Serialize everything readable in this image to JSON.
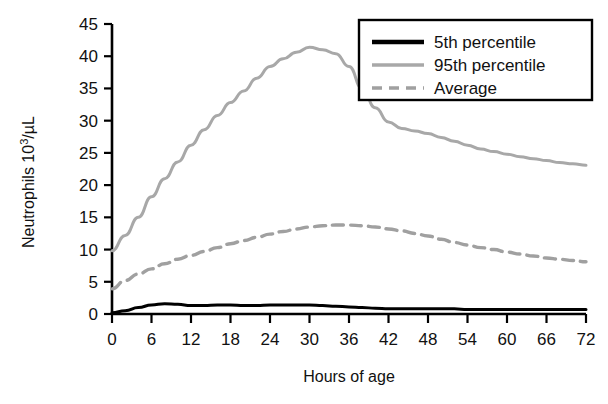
{
  "chart_data": {
    "type": "line",
    "title": "",
    "xlabel": "Hours of age",
    "ylabel": "Neutrophils 10",
    "ylabel_sup": "3",
    "ylabel_tail": "/µL",
    "ylabel_full": "Neutrophils 10³/µL",
    "xlim": [
      0,
      72
    ],
    "ylim": [
      0,
      45
    ],
    "xticks": [
      0,
      6,
      12,
      18,
      24,
      30,
      36,
      42,
      48,
      54,
      60,
      66,
      72
    ],
    "yticks": [
      0,
      5,
      10,
      15,
      20,
      25,
      30,
      35,
      40,
      45
    ],
    "xtick_labels": [
      "0",
      "6",
      "12",
      "18",
      "24",
      "30",
      "36",
      "42",
      "48",
      "54",
      "60",
      "66",
      "72"
    ],
    "ytick_labels": [
      "0",
      "5",
      "10",
      "15",
      "20",
      "25",
      "30",
      "35",
      "40",
      "45"
    ],
    "grid": false,
    "legend_position": "top-right",
    "x": [
      0,
      2,
      4,
      6,
      8,
      10,
      12,
      14,
      16,
      18,
      20,
      22,
      24,
      26,
      28,
      30,
      32,
      34,
      36,
      38,
      40,
      42,
      44,
      46,
      48,
      50,
      52,
      54,
      56,
      58,
      60,
      62,
      64,
      66,
      68,
      70,
      72
    ],
    "series": [
      {
        "name": "5th percentile",
        "style": "solid",
        "color": "#000000",
        "width": 3.0,
        "values": [
          0.2,
          0.5,
          1.0,
          1.4,
          1.6,
          1.5,
          1.3,
          1.3,
          1.4,
          1.4,
          1.3,
          1.3,
          1.4,
          1.4,
          1.4,
          1.4,
          1.3,
          1.2,
          1.1,
          1.0,
          0.9,
          0.8,
          0.8,
          0.8,
          0.8,
          0.8,
          0.8,
          0.7,
          0.7,
          0.7,
          0.7,
          0.7,
          0.7,
          0.7,
          0.7,
          0.7,
          0.7
        ]
      },
      {
        "name": "95th percentile",
        "style": "solid",
        "color": "#a8a8a8",
        "width": 3.0,
        "values": [
          9.8,
          12.2,
          15.0,
          18.2,
          21.0,
          23.6,
          26.2,
          28.6,
          30.8,
          32.8,
          34.6,
          36.6,
          38.4,
          39.6,
          40.6,
          41.4,
          41.0,
          40.4,
          38.4,
          35.0,
          32.0,
          29.8,
          28.8,
          28.4,
          28.0,
          27.4,
          26.8,
          26.2,
          25.6,
          25.2,
          24.8,
          24.4,
          24.1,
          23.8,
          23.5,
          23.3,
          23.1
        ]
      },
      {
        "name": "Average",
        "style": "dashed",
        "color": "#a0a0a0",
        "width": 3.4,
        "values": [
          3.9,
          5.2,
          6.2,
          7.0,
          7.8,
          8.5,
          9.1,
          9.7,
          10.3,
          10.9,
          11.4,
          11.9,
          12.4,
          12.8,
          13.2,
          13.5,
          13.7,
          13.8,
          13.8,
          13.7,
          13.5,
          13.2,
          12.9,
          12.5,
          12.1,
          11.6,
          11.1,
          10.7,
          10.3,
          10.0,
          9.6,
          9.3,
          9.0,
          8.7,
          8.5,
          8.3,
          8.1
        ]
      }
    ],
    "annotations": []
  },
  "legend": {
    "entries": [
      {
        "label": "5th percentile",
        "swatch": "solid-black-line"
      },
      {
        "label": "95th percentile",
        "swatch": "solid-gray-line"
      },
      {
        "label": "Average",
        "swatch": "dashed-gray-line"
      }
    ]
  },
  "colors": {
    "axis": "#000000",
    "series_5th": "#000000",
    "series_95th": "#a8a8a8",
    "series_average": "#a0a0a0",
    "background": "#ffffff",
    "legend_border": "#000000"
  }
}
